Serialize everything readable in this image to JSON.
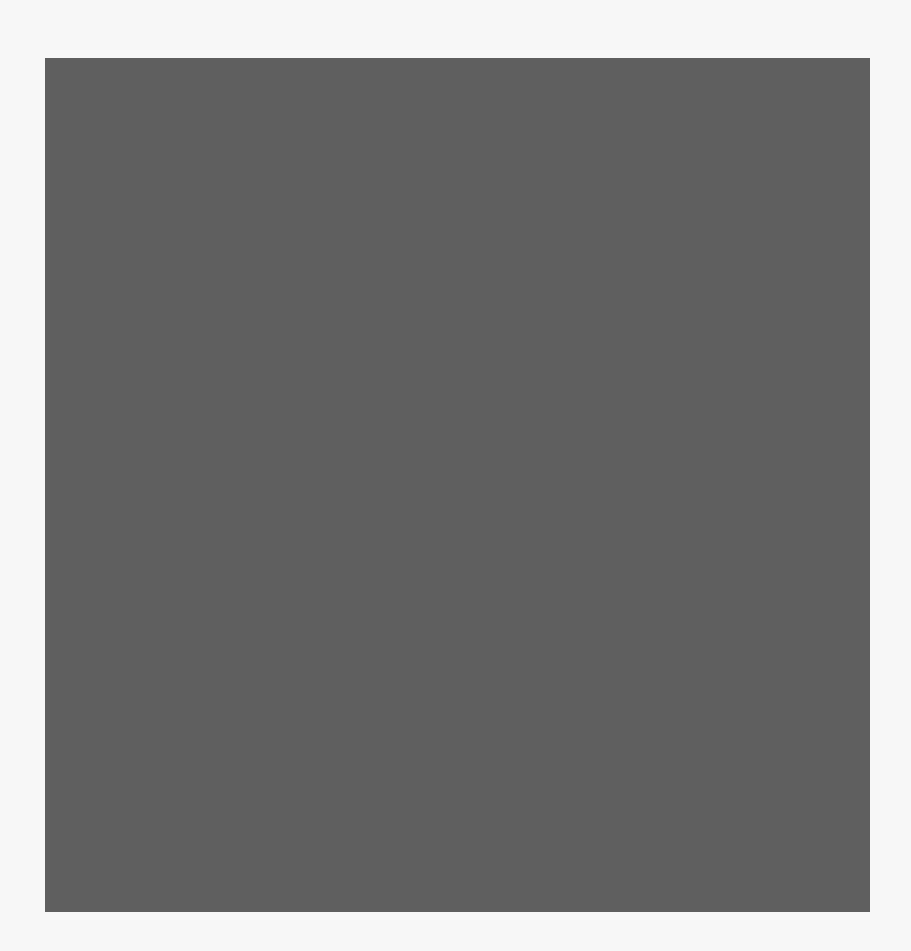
{
  "puzzle": {
    "type": "grid-puzzle",
    "rows": 13,
    "cols": 13,
    "legend": {
      "B": "filled-black",
      "W": "empty-white",
      "G": "marked-gray",
      "L": "label-column-light"
    },
    "colors": {
      "black": "#050505",
      "white": "#f6f6f6",
      "gray": "#8a8a8a",
      "label": "#f1f1f1",
      "gridline": "#5f5f5f",
      "background": "#f7f7f7"
    },
    "grid": [
      [
        "L",
        "B",
        "B",
        "W",
        "B",
        "B",
        "B",
        "W",
        "B",
        "W",
        "B",
        "B",
        "B"
      ],
      [
        "L",
        "G",
        "W",
        "W",
        "W",
        "W",
        "W",
        "W",
        "W",
        "W",
        "W",
        "G",
        "W"
      ],
      [
        "L",
        "W",
        "B",
        "W",
        "B",
        "W",
        "B",
        "B",
        "B",
        "W",
        "B",
        "W",
        "B"
      ],
      [
        "L",
        "W",
        "W",
        "W",
        "W",
        "W",
        "W",
        "W",
        "B",
        "W",
        "B",
        "W",
        "W"
      ],
      [
        "L",
        "B",
        "B",
        "W",
        "W",
        "B",
        "W",
        "W",
        "B",
        "W",
        "B",
        "W",
        "B"
      ],
      [
        "L",
        "W",
        "B",
        "G",
        "W",
        "G",
        "W",
        "G",
        "W",
        "G",
        "W",
        "W",
        "B"
      ],
      [
        "L",
        "W",
        "W",
        "W",
        "W",
        "W",
        "W",
        "W",
        "W",
        "W",
        "W",
        "W",
        "B"
      ],
      [
        "L",
        "W",
        "W",
        "G",
        "W",
        "G",
        "W",
        "G",
        "W",
        "G",
        "B",
        "W",
        "W"
      ],
      [
        "L",
        "W",
        "B",
        "W",
        "B",
        "W",
        "W",
        "B",
        "W",
        "W",
        "B",
        "B",
        "B"
      ],
      [
        "L",
        "W",
        "B",
        "W",
        "B",
        "W",
        "W",
        "W",
        "W",
        "W",
        "W",
        "W",
        "W"
      ],
      [
        "L",
        "W",
        "B",
        "W",
        "B",
        "B",
        "B",
        "W",
        "B",
        "W",
        "B",
        "W",
        "B"
      ],
      [
        "L",
        "G",
        "W",
        "W",
        "W",
        "W",
        "W",
        "W",
        "W",
        "W",
        "W",
        "G",
        "B"
      ],
      [
        "L",
        "W",
        "B",
        "B",
        "B",
        "W",
        "B",
        "W",
        "B",
        "B",
        "B",
        "W",
        "B"
      ]
    ],
    "label_column_overlays": [
      {
        "row_start": 0,
        "row_end": 0
      },
      {
        "row_start": 2,
        "row_end": 2
      },
      {
        "row_start": 4,
        "row_end": 4
      },
      {
        "row_start": 6,
        "row_end": 8
      },
      {
        "row_start": 10,
        "row_end": 12
      }
    ]
  }
}
